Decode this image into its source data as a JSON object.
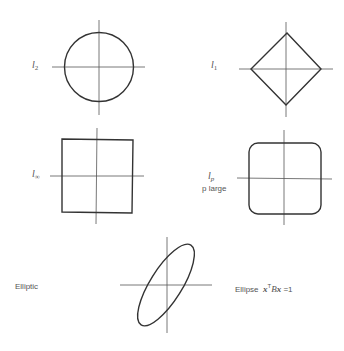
{
  "figure": {
    "panels": [
      {
        "id": "l2",
        "shape": "circle",
        "label_base": "l",
        "label_sub": "2",
        "description": "Unit ball of l2 norm"
      },
      {
        "id": "l1",
        "shape": "diamond",
        "label_base": "l",
        "label_sub": "1",
        "description": "Unit ball of l1 norm"
      },
      {
        "id": "linf",
        "shape": "square",
        "label_base": "l",
        "label_sub": "∞",
        "description": "Unit ball of l-infinity norm"
      },
      {
        "id": "lp",
        "shape": "rounded-square",
        "label_base": "l",
        "label_sub": "p",
        "label_line2": "p large",
        "description": "Unit ball of lp norm, p large"
      },
      {
        "id": "elliptic",
        "shape": "ellipse",
        "left_label": "Elliptic",
        "right_label_prefix": "Ellipse",
        "eq_x1": "x",
        "eq_T": "T",
        "eq_B": "B",
        "eq_x2": "x",
        "eq_rhs": "=1"
      }
    ]
  }
}
